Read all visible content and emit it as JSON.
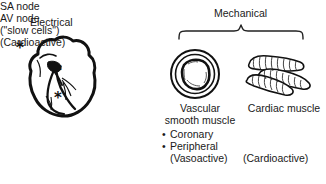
{
  "figure": {
    "background_color": "#ffffff",
    "ink_color": "#1a1a1a"
  },
  "electrical": {
    "title": "Electrical",
    "diagram_name": "heart-outline",
    "markers": [
      {
        "name": "asterisk-sa-node",
        "glyph": "*"
      },
      {
        "name": "asterisk-av-node",
        "glyph": "*"
      },
      {
        "name": "asterisk-conduction",
        "glyph": "*"
      }
    ],
    "labels": [
      "SA node",
      "AV node",
      "(\"slow cells\")",
      "(Cardioactive)"
    ]
  },
  "mechanical": {
    "title": "Mechanical",
    "bracket_name": "curly-brace",
    "vascular": {
      "diagram_name": "vessel-cross-section",
      "label_line1": "Vascular",
      "label_line2": "smooth muscle",
      "bullets": [
        {
          "dot": "•",
          "text": "Coronary"
        },
        {
          "dot": "•",
          "text": "Peripheral"
        }
      ],
      "note": "(Vasoactive)"
    },
    "cardiac": {
      "diagram_name": "cardiac-muscle-fibers",
      "label": "Cardiac muscle",
      "note": "(Cardioactive)"
    }
  }
}
